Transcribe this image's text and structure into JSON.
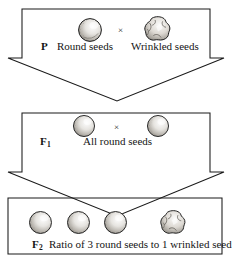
{
  "figure": {
    "ink_color": "#141414",
    "background_color": "#ffffff",
    "cross_symbol": "×"
  },
  "generations": [
    {
      "id": "p",
      "label": "P",
      "label_sub": "",
      "cross_symbol": "×",
      "parents": [
        {
          "phenotype": "Round seeds",
          "seed_type": "round"
        },
        {
          "phenotype": "Wrinkled seeds",
          "seed_type": "wrinkled"
        }
      ]
    },
    {
      "id": "f1",
      "label": "F",
      "label_sub": "1",
      "cross_symbol": "×",
      "description": "All round seeds",
      "offspring": [
        {
          "seed_type": "round"
        },
        {
          "seed_type": "round"
        }
      ]
    },
    {
      "id": "f2",
      "label": "F",
      "label_sub": "2",
      "description": "Ratio of 3 round seeds to 1 wrinkled seed",
      "offspring": [
        {
          "seed_type": "round"
        },
        {
          "seed_type": "round"
        },
        {
          "seed_type": "round"
        },
        {
          "seed_type": "wrinkled"
        }
      ]
    }
  ]
}
